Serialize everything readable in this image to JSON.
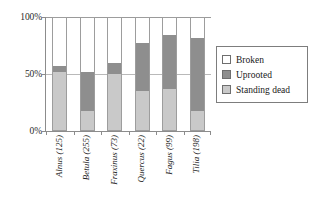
{
  "chart_data": {
    "type": "bar",
    "subtype": "stacked-100-percent",
    "title": "",
    "xlabel": "",
    "ylabel": "",
    "ylim": [
      0,
      100
    ],
    "ytick_labels": [
      "100%",
      "50%",
      "0%"
    ],
    "ytick_values": [
      100,
      50,
      0
    ],
    "grid": true,
    "gridlines_at": [
      50,
      100
    ],
    "legend_position": "right",
    "categories": [
      "Alnus (125)",
      "Betula (255)",
      "Fraxinus (73)",
      "Quercus (22)",
      "Fagus (99)",
      "Tilia (198)"
    ],
    "category_sample_sizes": [
      125,
      255,
      73,
      22,
      99,
      198
    ],
    "series": [
      {
        "name": "Broken",
        "color": "#ffffff",
        "values": [
          43,
          48,
          40,
          22,
          15,
          18
        ]
      },
      {
        "name": "Uprooted",
        "color": "#8e8e8e",
        "values": [
          5,
          35,
          10,
          43,
          48,
          65
        ]
      },
      {
        "name": "Standing dead",
        "color": "#c9c9c9",
        "values": [
          52,
          17,
          50,
          35,
          37,
          17
        ]
      }
    ]
  },
  "axis": {
    "y_ticks": [
      {
        "label": "100%",
        "value": 100
      },
      {
        "label": "50%",
        "value": 50
      },
      {
        "label": "0%",
        "value": 0
      }
    ]
  },
  "legend": {
    "items": [
      {
        "label": "Broken",
        "color": "#ffffff"
      },
      {
        "label": "Uprooted",
        "color": "#8e8e8e"
      },
      {
        "label": "Standing dead",
        "color": "#c9c9c9"
      }
    ]
  }
}
